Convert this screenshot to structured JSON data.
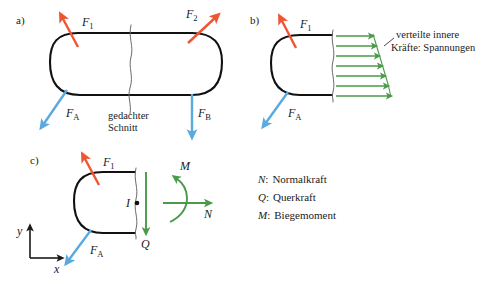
{
  "figure": {
    "background": "#ffffff",
    "colors": {
      "body_outline": "#111111",
      "force_red": "#ef5533",
      "force_blue": "#5aa9e0",
      "stress_green": "#4a9a4a",
      "cut_line_gray": "#5a5a5a",
      "text": "#1a1a1a"
    }
  },
  "panels": {
    "a": {
      "label": "a)",
      "forces": [
        {
          "name": "F1",
          "symbol": "F",
          "subscript": "1",
          "color": "#ef5533",
          "direction": "up-left"
        },
        {
          "name": "F2",
          "symbol": "F",
          "subscript": "2",
          "color": "#ef5533",
          "direction": "up-right"
        },
        {
          "name": "FA",
          "symbol": "F",
          "subscript": "A",
          "color": "#5aa9e0",
          "direction": "down-left"
        },
        {
          "name": "FB",
          "symbol": "F",
          "subscript": "B",
          "color": "#5aa9e0",
          "direction": "down"
        }
      ],
      "cut_label_line1": "gedachter",
      "cut_label_line2": "Schnitt"
    },
    "b": {
      "label": "b)",
      "forces": [
        {
          "name": "F1",
          "symbol": "F",
          "subscript": "1",
          "color": "#ef5533",
          "direction": "up-left"
        },
        {
          "name": "FA",
          "symbol": "F",
          "subscript": "A",
          "color": "#5aa9e0",
          "direction": "down-left"
        }
      ],
      "stress_label_line1": "verteilte innere",
      "stress_label_line2": "Kräfte: Spannungen",
      "stress_arrow_count": 7
    },
    "c": {
      "label": "c)",
      "forces": [
        {
          "name": "F1",
          "symbol": "F",
          "subscript": "1",
          "color": "#ef5533",
          "direction": "up-left"
        },
        {
          "name": "FA",
          "symbol": "F",
          "subscript": "A",
          "color": "#5aa9e0",
          "direction": "down-left"
        }
      ],
      "point_label": "I",
      "resultants": [
        {
          "name": "Q",
          "symbol": "Q",
          "color": "#4a9a4a",
          "direction": "down"
        },
        {
          "name": "N",
          "symbol": "N",
          "color": "#4a9a4a",
          "direction": "right"
        },
        {
          "name": "M",
          "symbol": "M",
          "color": "#4a9a4a",
          "direction": "moment-ccw"
        }
      ],
      "axes": {
        "x_label": "x",
        "y_label": "y"
      }
    }
  },
  "legend": {
    "entries": [
      {
        "symbol": "N",
        "separator": ":",
        "description": "Normalkraft"
      },
      {
        "symbol": "Q",
        "separator": ":",
        "description": "Querkraft"
      },
      {
        "symbol": "M",
        "separator": ":",
        "description": "Biegemoment"
      }
    ]
  }
}
